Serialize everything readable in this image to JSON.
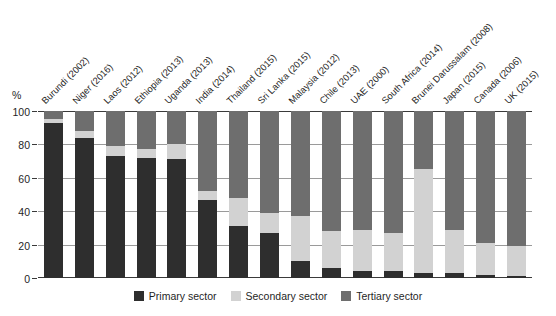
{
  "chart_data": {
    "type": "bar",
    "subtype": "stacked-100-percent",
    "title": "",
    "xlabel": "",
    "ylabel": "%",
    "ylim": [
      0,
      100
    ],
    "yticks": [
      0,
      20,
      40,
      60,
      80,
      100
    ],
    "ytick_labels": [
      "0",
      "20",
      "40",
      "60",
      "80",
      "100"
    ],
    "grid": true,
    "legend_position": "bottom-center",
    "categories": [
      "Burundi (2002)",
      "Niger (2016)",
      "Laos (2012)",
      "Ethiopia (2013)",
      "Uganda (2013)",
      "India (2014)",
      "Thailand (2015)",
      "Sri Lanka (2015)",
      "Malaysia (2012)",
      "Chile (2013)",
      "UAE (2000)",
      "South Africa (2014)",
      "Brunei Darussalam (2008)",
      "Japan (2015)",
      "Canada (2006)",
      "UK (2015)"
    ],
    "series": [
      {
        "name": "Primary sector",
        "color": "#2e2e2e",
        "values": [
          93,
          84,
          73,
          72,
          71,
          47,
          31,
          27,
          10,
          6,
          4,
          4,
          3,
          3,
          2,
          1
        ]
      },
      {
        "name": "Secondary sector",
        "color": "#d2d2d2",
        "values": [
          2,
          4,
          6,
          5,
          9,
          5,
          17,
          12,
          27,
          22,
          25,
          23,
          62,
          26,
          19,
          18
        ]
      },
      {
        "name": "Tertiary sector",
        "color": "#6e6e6e",
        "values": [
          5,
          12,
          21,
          23,
          20,
          48,
          52,
          61,
          63,
          72,
          71,
          73,
          35,
          71,
          79,
          81
        ]
      }
    ]
  },
  "axis": {
    "unit_label": "%"
  },
  "legend": {
    "items": [
      {
        "label": "Primary sector",
        "color": "#2e2e2e"
      },
      {
        "label": "Secondary sector",
        "color": "#d2d2d2"
      },
      {
        "label": "Tertiary sector",
        "color": "#6e6e6e"
      }
    ]
  }
}
